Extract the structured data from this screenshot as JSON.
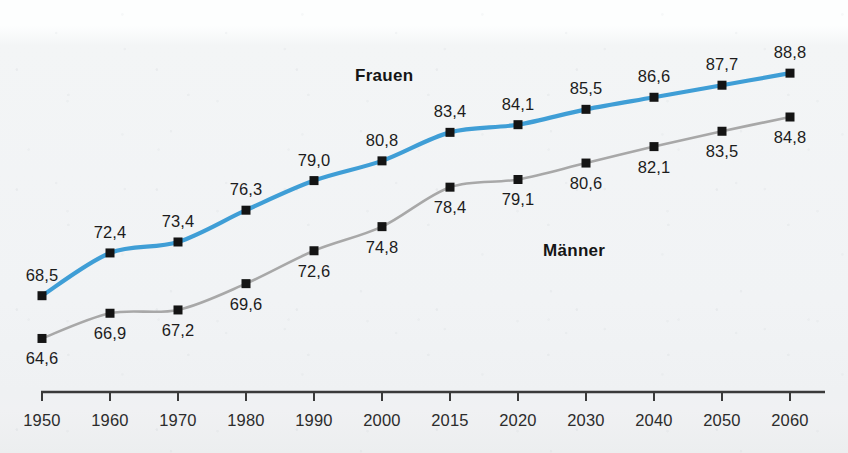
{
  "chart_data": {
    "type": "line",
    "title": "",
    "xlabel": "",
    "ylabel": "",
    "grid": false,
    "legend_position": "inline-annotation",
    "axis_color": "#3a3a3a",
    "categories": [
      "1950",
      "1960",
      "1970",
      "1980",
      "1990",
      "2000",
      "2015",
      "2020",
      "2030",
      "2040",
      "2050",
      "2060"
    ],
    "xlim": [
      1950,
      2060
    ],
    "ylim": [
      63.0,
      90.0
    ],
    "decimal_separator": ",",
    "series": [
      {
        "name": "Frauen",
        "color": "#3f9ed6",
        "marker": "square",
        "marker_color": "#141414",
        "values": [
          68.5,
          72.4,
          73.4,
          76.3,
          79.0,
          80.8,
          83.4,
          84.1,
          85.5,
          86.6,
          87.7,
          88.8
        ],
        "labels": [
          "68,5",
          "72,4",
          "73,4",
          "76,3",
          "79,0",
          "80,8",
          "83,4",
          "84,1",
          "85,5",
          "86,6",
          "87,7",
          "88,8"
        ],
        "label_positions": [
          "above",
          "above",
          "above",
          "above",
          "above",
          "above",
          "above",
          "above",
          "above",
          "above",
          "above",
          "above"
        ]
      },
      {
        "name": "Männer",
        "color": "#a8a8a8",
        "marker": "square",
        "marker_color": "#141414",
        "values": [
          64.6,
          66.9,
          67.2,
          69.6,
          72.6,
          74.8,
          78.4,
          79.1,
          80.6,
          82.1,
          83.5,
          84.8
        ],
        "labels": [
          "64,6",
          "66,9",
          "67,2",
          "69,6",
          "72,6",
          "74,8",
          "78,4",
          "79,1",
          "80,6",
          "82,1",
          "83,5",
          "84,8"
        ],
        "label_positions": [
          "below",
          "below",
          "below",
          "below",
          "below",
          "below",
          "below",
          "below",
          "below",
          "below",
          "below",
          "below"
        ]
      }
    ],
    "annotations": [
      {
        "text": "Frauen",
        "x": 355,
        "y": 66
      },
      {
        "text": "Männer",
        "x": 543,
        "y": 241
      }
    ]
  }
}
